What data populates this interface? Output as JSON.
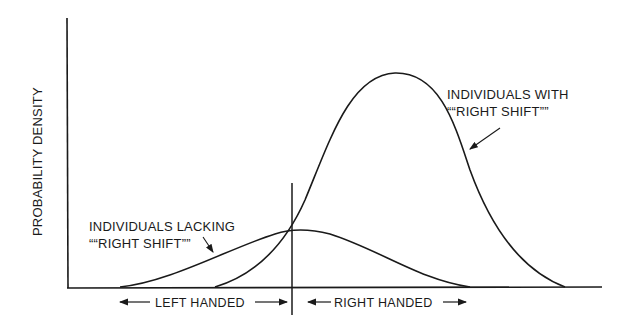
{
  "diagram": {
    "y_axis_label": "PROBABILITY DENSITY",
    "curves": [
      {
        "name": "lacking-right-shift",
        "label_line1": "INDIVIDUALS LACKING",
        "label_line2": "““RIGHT SHIFT””",
        "description": "Low, broad distribution centered near the handedness threshold"
      },
      {
        "name": "with-right-shift",
        "label_line1": "INDIVIDUALS WITH",
        "label_line2": "““RIGHT SHIFT””",
        "description": "Tall distribution shifted to the right of the threshold"
      }
    ],
    "x_regions": {
      "left": "LEFT HANDED",
      "right": "RIGHT HANDED"
    },
    "colors": {
      "ink": "#1a1a1a",
      "background": "#ffffff"
    }
  }
}
